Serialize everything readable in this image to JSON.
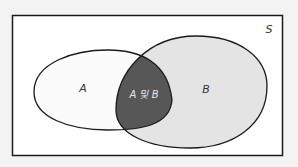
{
  "diagram": {
    "type": "venn",
    "universe": {
      "label": "S"
    },
    "sets": [
      {
        "id": "A",
        "label": "A",
        "fill": "#fbfbfb"
      },
      {
        "id": "B",
        "label": "B",
        "fill": "#e4e4e4"
      }
    ],
    "intersection": {
      "label": "A 및 B",
      "fill": "#575757"
    },
    "colors": {
      "background": "#f3f3f3",
      "universe_fill": "#ffffff",
      "stroke": "#1a1a1a"
    }
  }
}
